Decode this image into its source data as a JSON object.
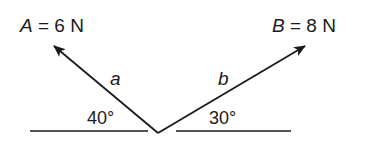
{
  "vectors": [
    {
      "name": "A",
      "magnitude_label": "A = 6 N",
      "var": "A",
      "eq": " = 6 N",
      "side_label": "a",
      "angle_label": "40°"
    },
    {
      "name": "B",
      "magnitude_label": "B = 8 N",
      "var": "B",
      "eq": " = 8 N",
      "side_label": "b",
      "angle_label": "30°"
    }
  ],
  "colors": {
    "ink": "#1a1a1a",
    "background": "#ffffff"
  }
}
